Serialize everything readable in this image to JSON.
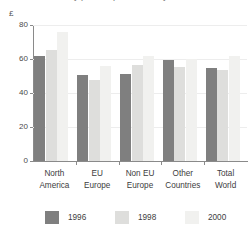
{
  "chart_data": {
    "type": "bar",
    "title": "by price of product and year",
    "xlabel": "",
    "ylabel": "£",
    "ylim": [
      0,
      80
    ],
    "yticks": [
      0,
      20,
      40,
      60,
      80
    ],
    "ytick_labels": [
      "0",
      "20",
      "40",
      "60",
      "80"
    ],
    "grid": true,
    "legend_position": "bottom",
    "categories": [
      "North America",
      "EU Europe",
      "Non EU Europe",
      "Other Countries",
      "Total World"
    ],
    "category_lines": [
      [
        "North",
        "America"
      ],
      [
        "EU",
        "Europe"
      ],
      [
        "Non EU",
        "Europe"
      ],
      [
        "Other",
        "Countries"
      ],
      [
        "Total",
        "World"
      ]
    ],
    "series": [
      {
        "name": "1996",
        "color": "#7f7f7f",
        "values": [
          62,
          50.5,
          51,
          59.5,
          55
        ]
      },
      {
        "name": "1998",
        "color": "#dededc",
        "values": [
          65.5,
          47.5,
          56.5,
          55.5,
          53.5
        ]
      },
      {
        "name": "2000",
        "color": "#f1f1ef",
        "values": [
          76,
          56,
          62,
          60,
          61.5
        ]
      }
    ]
  },
  "axis": {
    "y_unit_label": "£"
  }
}
